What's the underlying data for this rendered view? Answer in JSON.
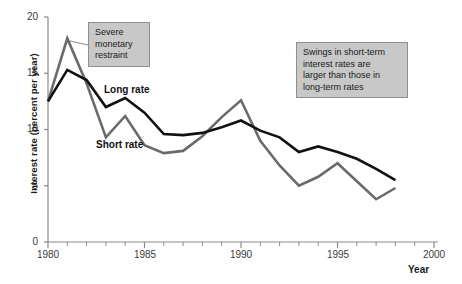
{
  "chart_data": {
    "type": "line",
    "title": "",
    "xlabel": "Year",
    "ylabel": "Interest rate (percent per year)",
    "xlim": [
      1980,
      2000
    ],
    "ylim": [
      0,
      20
    ],
    "xticks": [
      1980,
      1985,
      1990,
      1995,
      2000
    ],
    "xtick_labels": [
      "1980",
      "1985",
      "1990",
      "1995",
      "2000"
    ],
    "xminor_step": 1,
    "yticks": [
      0,
      5,
      10,
      15,
      20
    ],
    "ytick_labels": [
      "0",
      "5",
      "10",
      "15",
      "20"
    ],
    "grid": false,
    "legend": "inline-labels",
    "x": [
      1980,
      1981,
      1982,
      1983,
      1984,
      1985,
      1986,
      1987,
      1988,
      1989,
      1990,
      1991,
      1992,
      1993,
      1994,
      1995,
      1996,
      1997,
      1998
    ],
    "series": [
      {
        "name": "Long rate",
        "color": "#111111",
        "values": [
          12.5,
          15.3,
          14.4,
          12.0,
          12.8,
          11.5,
          9.6,
          9.5,
          9.7,
          10.2,
          10.8,
          9.9,
          9.3,
          8.0,
          8.5,
          8.0,
          7.4,
          6.5,
          5.5
        ]
      },
      {
        "name": "Short rate",
        "color": "#6a6a6a",
        "values": [
          12.5,
          18.1,
          14.1,
          9.3,
          11.2,
          8.6,
          7.9,
          8.1,
          9.4,
          11.1,
          12.6,
          9.0,
          6.8,
          5.0,
          5.8,
          7.0,
          5.4,
          3.8,
          4.8
        ]
      }
    ],
    "annotations": [
      {
        "id": "severe-monetary-restraint",
        "text": "Severe monetary restraint",
        "lines": [
          "Severe",
          "monetary",
          "restraint"
        ],
        "points_to": {
          "x": 1981,
          "y": 18.1
        }
      },
      {
        "id": "swings-note",
        "text": "Swings in short-term interest rates are larger than those in long-term rates",
        "lines": [
          "Swings in short-term",
          "interest rates are",
          "larger than those in",
          "long-term rates"
        ]
      }
    ],
    "series_labels": [
      {
        "id": "long-rate",
        "text": "Long rate"
      },
      {
        "id": "short-rate",
        "text": "Short rate"
      }
    ]
  },
  "colors": {
    "long_rate": "#111111",
    "short_rate": "#6a6a6a",
    "axis": "#8a8a8a",
    "annotation_bg": "#c8c8c8",
    "annotation_border": "#8f8f8f",
    "text": "#1a1a1a"
  }
}
